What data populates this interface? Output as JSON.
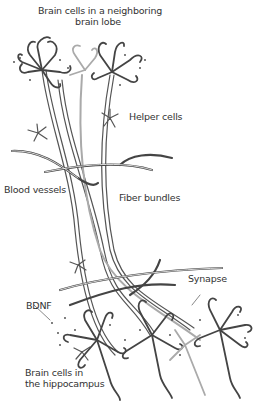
{
  "diagram": {
    "labels": {
      "top_cells_line1": "Brain cells in a neighboring",
      "top_cells_line2": "brain lobe",
      "helper_cells": "Helper cells",
      "blood_vessels": "Blood vessels",
      "fiber_bundles": "Fiber bundles",
      "synapse": "Synapse",
      "bdnf": "BDNF",
      "bottom_cells_line1": "Brain cells in",
      "bottom_cells_line2": "the hippocampus"
    },
    "colors": {
      "ink": "#333333",
      "fiber_dark": "#555555",
      "fiber_light": "#aaaaaa",
      "background": "#ffffff"
    }
  }
}
